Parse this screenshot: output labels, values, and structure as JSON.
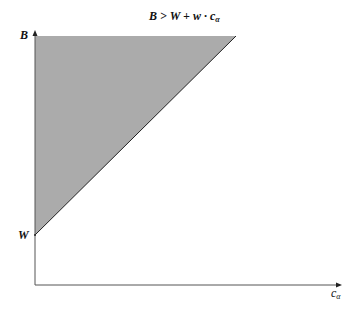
{
  "diagram": {
    "title": "B > W + w · c",
    "title_subscript": "α",
    "y_labels": {
      "top": "B",
      "bottom": "W"
    },
    "x_label": "c",
    "x_label_subscript": "α",
    "region": {
      "description": "shaded triangle where B > W + w·cα",
      "fill": "#ababab",
      "vertices": [
        [
          35,
          36
        ],
        [
          236,
          36
        ],
        [
          35,
          235
        ]
      ]
    },
    "axes": {
      "origin": [
        35,
        285
      ],
      "x_end": [
        342,
        285
      ],
      "y_end": [
        35,
        32
      ],
      "color": "#555555"
    }
  }
}
